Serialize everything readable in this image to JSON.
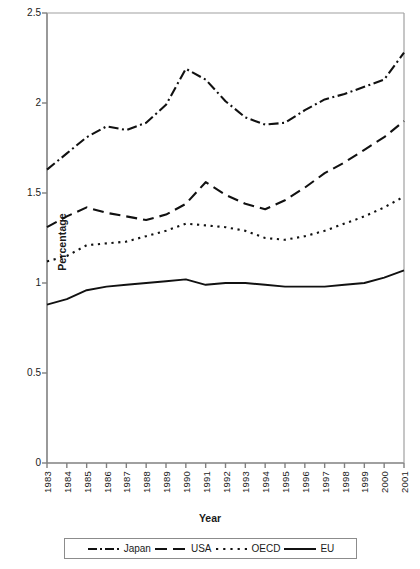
{
  "chart_data": {
    "type": "line",
    "title": "",
    "xlabel": "Year",
    "ylabel": "Percentage",
    "xlim": [
      1983,
      2001
    ],
    "ylim": [
      0,
      2.5
    ],
    "yticks": [
      "0",
      "0.5",
      "1",
      "1.5",
      "2",
      "2.5"
    ],
    "ytick_values": [
      0,
      0.5,
      1,
      1.5,
      2,
      2.5
    ],
    "grid": false,
    "legend_position": "bottom",
    "categories": [
      1983,
      1984,
      1985,
      1986,
      1987,
      1988,
      1989,
      1990,
      1991,
      1992,
      1993,
      1994,
      1995,
      1996,
      1997,
      1998,
      1999,
      2000,
      2001
    ],
    "xtick_labels": [
      "1983",
      "1984",
      "1985",
      "1986",
      "1987",
      "1988",
      "1989",
      "1990",
      "1991",
      "1992",
      "1993",
      "1994",
      "1995",
      "1996",
      "1997",
      "1998",
      "1999",
      "2000",
      "2001"
    ],
    "series": [
      {
        "name": "Japan",
        "style": "dash-dot",
        "color": "#111111",
        "values": [
          1.63,
          1.72,
          1.81,
          1.87,
          1.85,
          1.89,
          1.99,
          2.19,
          2.13,
          2.01,
          1.92,
          1.88,
          1.89,
          1.96,
          2.02,
          2.05,
          2.09,
          2.13,
          2.28
        ]
      },
      {
        "name": "USA",
        "style": "dashed",
        "color": "#111111",
        "values": [
          1.31,
          1.37,
          1.42,
          1.39,
          1.37,
          1.35,
          1.38,
          1.44,
          1.56,
          1.49,
          1.44,
          1.41,
          1.46,
          1.53,
          1.61,
          1.67,
          1.74,
          1.81,
          1.9
        ]
      },
      {
        "name": "OECD",
        "style": "dotted",
        "color": "#111111",
        "values": [
          1.12,
          1.15,
          1.21,
          1.22,
          1.23,
          1.26,
          1.29,
          1.33,
          1.32,
          1.31,
          1.29,
          1.25,
          1.24,
          1.26,
          1.29,
          1.33,
          1.37,
          1.42,
          1.48
        ]
      },
      {
        "name": "EU",
        "style": "solid",
        "color": "#111111",
        "values": [
          0.88,
          0.91,
          0.96,
          0.98,
          0.99,
          1.0,
          1.01,
          1.02,
          0.99,
          1.0,
          1.0,
          0.99,
          0.98,
          0.98,
          0.98,
          0.99,
          1.0,
          1.03,
          1.07
        ]
      }
    ]
  },
  "legend": {
    "items": [
      {
        "label": "Japan",
        "style": "dash-dot"
      },
      {
        "label": "USA",
        "style": "dashed"
      },
      {
        "label": "OECD",
        "style": "dotted"
      },
      {
        "label": "EU",
        "style": "solid"
      }
    ]
  },
  "axes": {
    "y_title": "Percentage",
    "x_title": "Year"
  }
}
